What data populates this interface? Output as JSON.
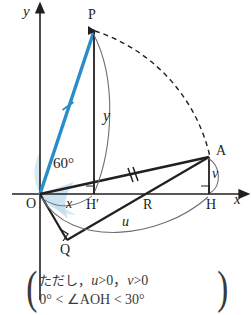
{
  "figure": {
    "axes": {
      "x_label": "x",
      "y_label": "y",
      "origin_label": "O"
    },
    "points": [
      {
        "name": "P",
        "label": "P",
        "x": 94,
        "y": 30
      },
      {
        "name": "A",
        "label": "A",
        "x": 209,
        "y": 157
      },
      {
        "name": "Hprime",
        "label": "H′",
        "x": 94,
        "y": 194
      },
      {
        "name": "R",
        "label": "R",
        "x": 148,
        "y": 194
      },
      {
        "name": "H",
        "label": "H",
        "x": 209,
        "y": 194
      },
      {
        "name": "Q",
        "label": "Q",
        "x": 67,
        "y": 240
      },
      {
        "name": "O",
        "label": "O",
        "x": 40,
        "y": 194
      }
    ],
    "measures": {
      "angle_label": "60°",
      "x_segment_label": "x",
      "y_segment_label": "y",
      "u_arc_label": "u",
      "v_segment_label": "v"
    },
    "colors": {
      "segment_OP": "#2a8cc8",
      "angle_fill": "#b9dcf0",
      "stroke": "#231f20",
      "thin_stroke": "#6f6f6f",
      "text": "#231f20",
      "note_text": "#3a3a3a",
      "background": "#ffffff"
    },
    "tick_marks": {
      "OP_ticks": 1,
      "OA_ticks": 2
    },
    "right_angle_marks": [
      "H′",
      "H",
      "Q"
    ],
    "dashed_arc": "arc from P to A centered at O"
  },
  "note": {
    "open_paren": "(",
    "close_paren": ")",
    "line1_prefix": "ただし，",
    "line1_cond1": "u",
    "line1_cond1_rest": ">0，",
    "line1_cond2": "v",
    "line1_cond2_rest": ">0",
    "line2": "0° < ∠AOH < 30°"
  }
}
